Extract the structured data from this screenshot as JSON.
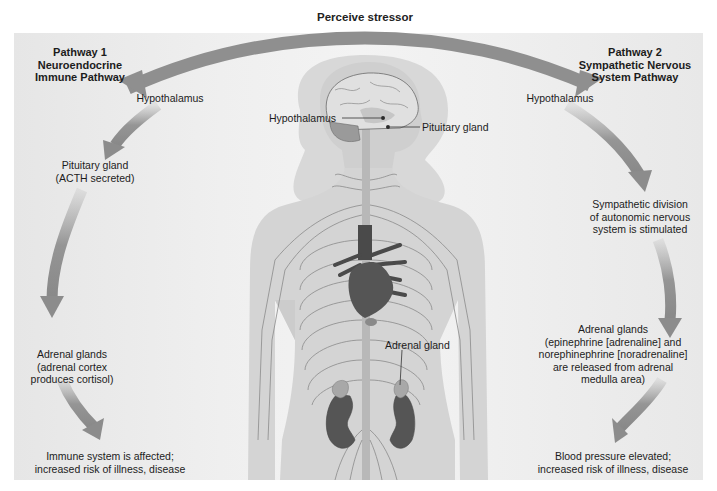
{
  "diagram": {
    "top_arrow_label": "Perceive stressor",
    "pathway1": {
      "title_line1": "Pathway 1",
      "title_line2": "Neuroendocrine",
      "title_line3": "Immune Pathway",
      "steps": [
        {
          "line1": "Hypothalamus"
        },
        {
          "line1": "Pituitary gland",
          "line2": "(ACTH secreted)"
        },
        {
          "line1": "Adrenal glands",
          "line2": "(adrenal cortex",
          "line3": "produces cortisol)"
        },
        {
          "line1": "Immune system is affected;",
          "line2": "increased risk of illness, disease"
        }
      ]
    },
    "pathway2": {
      "title_line1": "Pathway 2",
      "title_line2": "Sympathetic Nervous",
      "title_line3": "System Pathway",
      "steps": [
        {
          "line1": "Hypothalamus"
        },
        {
          "line1": "Sympathetic division",
          "line2": "of autonomic nervous",
          "line3": "system is stimulated"
        },
        {
          "line1": "Adrenal glands",
          "line2": "(epinephrine [adrenaline] and",
          "line3": "norephinephrine [noradrenaline]",
          "line4": "are released from adrenal",
          "line5": "medulla area)"
        },
        {
          "line1": "Blood pressure elevated;",
          "line2": "increased risk of illness, disease"
        }
      ]
    },
    "body_labels": {
      "hypothalamus": "Hypothalamus",
      "pituitary": "Pituitary gland",
      "adrenal": "Adrenal gland"
    },
    "colors": {
      "arrow": "#8c8c8c",
      "body": "#d4d4d4",
      "organ_dark": "#5a5a5a",
      "adrenal": "#a8a8a8",
      "panel": "#ececec"
    }
  }
}
